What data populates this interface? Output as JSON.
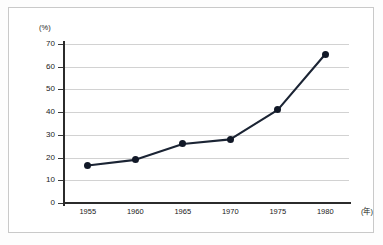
{
  "chart_data": {
    "type": "line",
    "title": "",
    "subtitle": "",
    "xlabel": "(年)",
    "ylabel": "(%)",
    "x": [
      1955,
      1960,
      1965,
      1970,
      1975,
      1980
    ],
    "categories": [
      "1955",
      "1960",
      "1965",
      "1970",
      "1975",
      "1980"
    ],
    "values": [
      16.5,
      19,
      26,
      28,
      41,
      65.5
    ],
    "series": [
      {
        "name": "",
        "values": [
          16.5,
          19,
          26,
          28,
          41,
          65.5
        ]
      }
    ],
    "xlim": [
      1952.5,
      1982.5
    ],
    "ylim": [
      0,
      70
    ],
    "yticks": [
      0,
      10,
      20,
      30,
      40,
      50,
      60,
      70
    ],
    "ytick_labels": [
      "0",
      "10",
      "20",
      "30",
      "40",
      "50",
      "60",
      "70"
    ],
    "xticks": [
      1955,
      1960,
      1965,
      1970,
      1975,
      1980
    ],
    "xtick_labels": [
      "1955",
      "1960",
      "1965",
      "1970",
      "1975",
      "1980"
    ],
    "grid": "horizontal",
    "legend": "none",
    "marker": "filled-circle",
    "line_color": "#1b2434",
    "marker_color": "#111827",
    "grid_color": "#d2d2d2",
    "axis_color": "#2b2b2b",
    "background": "#ffffff"
  }
}
